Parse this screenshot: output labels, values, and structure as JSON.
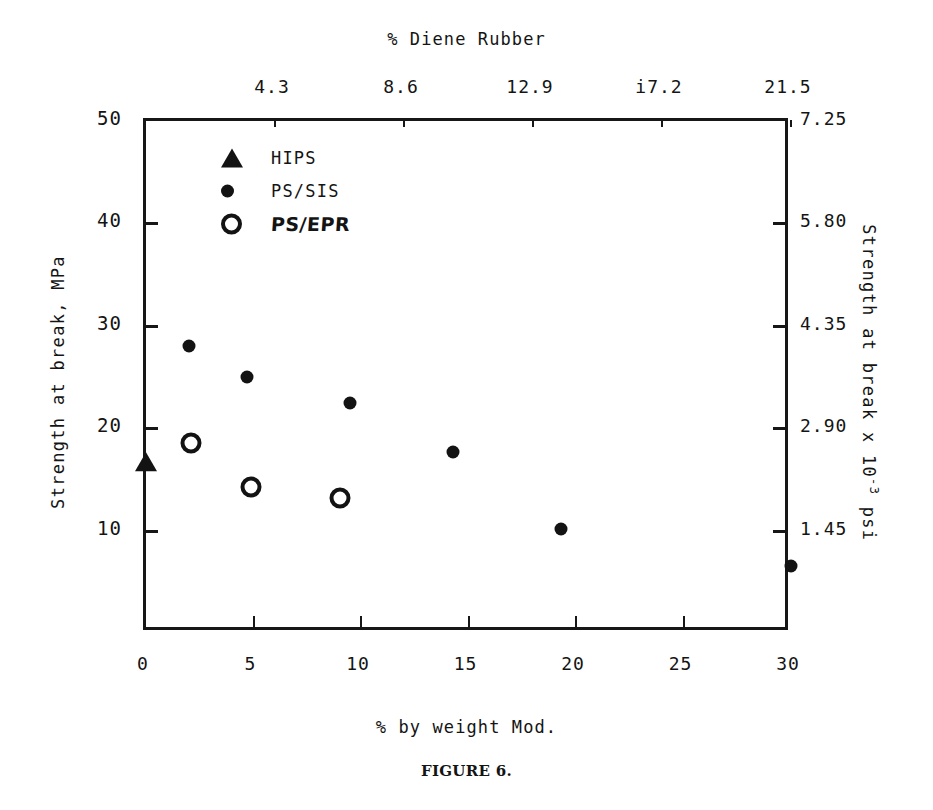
{
  "chart_data": {
    "type": "scatter",
    "title": "",
    "caption": "FIGURE 6.",
    "xlabel": "% by weight Mod.",
    "ylabel": "Strength at break, MPa",
    "top_axis_label": "% Diene Rubber",
    "right_axis_label_parts": {
      "pre": "Strength at break  x 10",
      "sup": "-3",
      "post": " psi"
    },
    "xlim": [
      0,
      30
    ],
    "ylim": [
      0,
      50
    ],
    "y2lim": [
      0,
      7.25
    ],
    "xticks": [
      "0",
      "5",
      "10",
      "15",
      "20",
      "25",
      "30"
    ],
    "xtick_values": [
      0,
      5,
      10,
      15,
      20,
      25,
      30
    ],
    "yticks": [
      "50",
      "40",
      "30",
      "20",
      "10"
    ],
    "ytick_values": [
      50,
      40,
      30,
      20,
      10
    ],
    "top_ticks": [
      "4.3",
      "8.6",
      "12.9",
      "i7.2",
      "21.5"
    ],
    "top_tick_x_values": [
      6,
      12,
      18,
      24,
      30
    ],
    "right_ticks": [
      "7.25",
      "5.80",
      "4.35",
      "2.90",
      "1.45"
    ],
    "right_tick_y_values": [
      50,
      40,
      30,
      20,
      10
    ],
    "grid": false,
    "legend_position": "upper-left-inside",
    "series": [
      {
        "name": "HIPS",
        "marker": "filled-triangle",
        "points": [
          {
            "x": 0,
            "y": 17.0
          }
        ]
      },
      {
        "name": "PS/SIS",
        "marker": "filled-circle",
        "points": [
          {
            "x": 2.0,
            "y": 28.0
          },
          {
            "x": 4.7,
            "y": 25.0
          },
          {
            "x": 9.5,
            "y": 22.5
          },
          {
            "x": 14.3,
            "y": 17.7
          },
          {
            "x": 19.3,
            "y": 10.2
          },
          {
            "x": 30.0,
            "y": 6.5
          }
        ]
      },
      {
        "name": "PS/EPR",
        "marker": "open-circle",
        "points": [
          {
            "x": 2.1,
            "y": 18.6
          },
          {
            "x": 4.9,
            "y": 14.3
          },
          {
            "x": 9.0,
            "y": 13.2
          }
        ]
      }
    ]
  },
  "legend": {
    "items": [
      {
        "label": "HIPS",
        "marker": "filled-triangle",
        "style": "typed"
      },
      {
        "label": "PS/SIS",
        "marker": "filled-circle",
        "style": "typed"
      },
      {
        "label": "PS/EPR",
        "marker": "open-circle",
        "style": "handwritten"
      }
    ]
  }
}
